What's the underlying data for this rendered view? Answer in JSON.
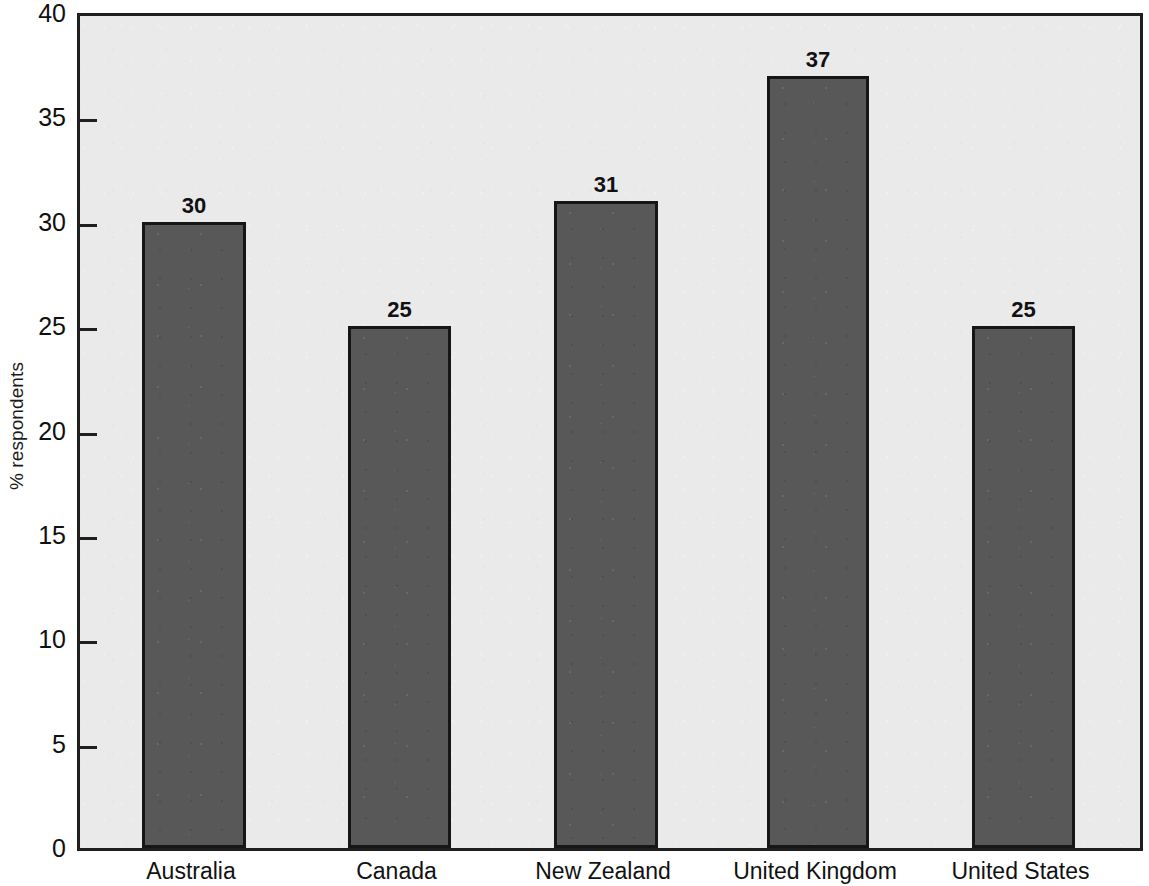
{
  "chart_data": {
    "type": "bar",
    "title": "",
    "subtitle": "",
    "xlabel": "",
    "ylabel": "% respondents",
    "categories": [
      "Australia",
      "Canada",
      "New Zealand",
      "United Kingdom",
      "United States"
    ],
    "values": [
      30,
      25,
      31,
      37,
      25
    ],
    "value_labels": [
      "30",
      "25",
      "31",
      "37",
      "25"
    ],
    "series": [
      {
        "name": "% respondents",
        "values": [
          30,
          25,
          31,
          37,
          25
        ]
      }
    ],
    "ylim": [
      0,
      40
    ],
    "xlim": [
      0,
      5
    ],
    "yticks": [
      0,
      5,
      10,
      15,
      20,
      25,
      30,
      35,
      40
    ],
    "ytick_labels": [
      "0",
      "5",
      "10",
      "15",
      "20",
      "25",
      "30",
      "35",
      "40"
    ],
    "grid": false,
    "legend": false,
    "legend_position": "none",
    "bar_color": "#585858",
    "bar_border_color": "#161616",
    "plot_background": "#eaeaea",
    "axis_color": "#1f1f1f",
    "text_color": "#111111",
    "tick_direction": "in",
    "annotations": [
      {
        "text": "30",
        "category": "Australia",
        "value": 30
      },
      {
        "text": "25",
        "category": "Canada",
        "value": 25
      },
      {
        "text": "31",
        "category": "New Zealand",
        "value": 31
      },
      {
        "text": "37",
        "category": "United Kingdom",
        "value": 37
      },
      {
        "text": "25",
        "category": "United States",
        "value": 25
      }
    ]
  },
  "geometry": {
    "bar_left_px": [
      139,
      345,
      551,
      764,
      969
    ],
    "bar_width_px": [
      104,
      103,
      104,
      102,
      103
    ]
  }
}
